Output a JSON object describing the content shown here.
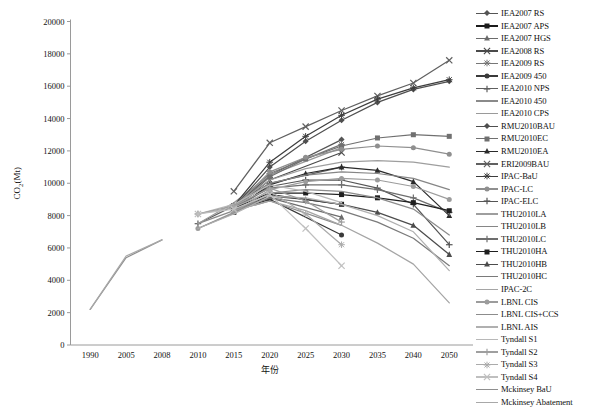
{
  "chart_data": {
    "type": "line",
    "title": "",
    "xlabel": "年份",
    "ylabel": "CO2(Mt)",
    "ylabel_parts": {
      "main": "CO",
      "sub": "2",
      "unit": "(Mt)"
    },
    "categories": [
      "1990",
      "2005",
      "2008",
      "2010",
      "2015",
      "2020",
      "2025",
      "2030",
      "2035",
      "2040",
      "2050"
    ],
    "ylim": [
      0,
      20000
    ],
    "ytick_labels": [
      "0",
      "2000",
      "4000",
      "6000",
      "8000",
      "10000",
      "12000",
      "14000",
      "16000",
      "18000",
      "20000"
    ],
    "ytick_values": [
      0,
      2000,
      4000,
      6000,
      8000,
      10000,
      12000,
      14000,
      16000,
      18000,
      20000
    ],
    "grid": false,
    "legend_position": "right",
    "series": [
      {
        "name": "IEA2007 RS",
        "marker": "diamond",
        "color": "#555555",
        "values": [
          null,
          null,
          null,
          null,
          8500,
          10500,
          null,
          12700,
          null,
          null,
          null
        ]
      },
      {
        "name": "IEA2007 APS",
        "marker": "square",
        "color": "#1c1c1c",
        "values": [
          null,
          null,
          null,
          null,
          8200,
          9300,
          null,
          8700,
          null,
          null,
          null
        ]
      },
      {
        "name": "IEA2007 HGS",
        "marker": "triangle",
        "color": "#6b6b6b",
        "values": [
          null,
          null,
          null,
          null,
          8350,
          9100,
          null,
          7900,
          null,
          null,
          null
        ]
      },
      {
        "name": "IEA2008 RS",
        "marker": "cross",
        "color": "#4a4a4a",
        "values": [
          null,
          null,
          null,
          null,
          8450,
          10200,
          null,
          11900,
          null,
          null,
          null
        ]
      },
      {
        "name": "IEA2009 RS",
        "marker": "star",
        "color": "#777777",
        "values": [
          null,
          null,
          null,
          null,
          8550,
          10600,
          null,
          12400,
          null,
          null,
          null
        ]
      },
      {
        "name": "IEA2009 450",
        "marker": "circle",
        "color": "#3a3a3a",
        "values": [
          null,
          null,
          null,
          null,
          8300,
          9000,
          null,
          6800,
          null,
          null,
          null
        ]
      },
      {
        "name": "IEA2010 NPS",
        "marker": "plus",
        "color": "#5f5f5f",
        "values": [
          null,
          null,
          null,
          7500,
          8600,
          10000,
          null,
          11000,
          null,
          null,
          null
        ]
      },
      {
        "name": "IEA2010 450",
        "marker": "dash",
        "color": "#8a8a8a",
        "values": [
          null,
          null,
          null,
          7500,
          8300,
          8900,
          null,
          7400,
          null,
          null,
          null
        ]
      },
      {
        "name": "IEA2010 CPS",
        "marker": "dash",
        "color": "#9a9a9a",
        "values": [
          null,
          null,
          null,
          7500,
          8800,
          10500,
          null,
          12200,
          null,
          null,
          null
        ]
      },
      {
        "name": "RMU2010BAU",
        "marker": "diamond",
        "color": "#4f4f4f",
        "values": [
          null,
          null,
          null,
          null,
          8500,
          11000,
          12600,
          13900,
          15000,
          15800,
          16300
        ]
      },
      {
        "name": "RMU2010EC",
        "marker": "square",
        "color": "#707070",
        "values": [
          null,
          null,
          null,
          null,
          8400,
          10400,
          11500,
          12300,
          12800,
          13000,
          12900
        ]
      },
      {
        "name": "RMU2010EA",
        "marker": "triangle",
        "color": "#2b2b2b",
        "values": [
          null,
          null,
          null,
          null,
          8350,
          9900,
          10600,
          11000,
          10800,
          10100,
          8000
        ]
      },
      {
        "name": "ERI2009BAU",
        "marker": "cross",
        "color": "#606060",
        "values": [
          null,
          null,
          null,
          null,
          9500,
          12500,
          13500,
          14500,
          15400,
          16200,
          17600
        ]
      },
      {
        "name": "IPAC-BaU",
        "marker": "star",
        "color": "#3d3d3d",
        "values": [
          null,
          null,
          null,
          null,
          8600,
          11300,
          12900,
          14200,
          15200,
          15900,
          16400
        ]
      },
      {
        "name": "IPAC-LC",
        "marker": "circle",
        "color": "#8f8f8f",
        "values": [
          null,
          null,
          null,
          null,
          8500,
          10700,
          11600,
          12100,
          12300,
          12200,
          11800
        ]
      },
      {
        "name": "IPAC-ELC",
        "marker": "plus",
        "color": "#555555",
        "values": [
          null,
          null,
          null,
          null,
          8400,
          9800,
          10200,
          10200,
          9700,
          8700,
          6200
        ]
      },
      {
        "name": "THU2010LA",
        "marker": "dash",
        "color": "#9e9e9e",
        "values": [
          null,
          null,
          null,
          null,
          8600,
          10200,
          10900,
          11300,
          11400,
          11300,
          11000
        ]
      },
      {
        "name": "THU2010LB",
        "marker": "dash",
        "color": "#868686",
        "values": [
          null,
          null,
          null,
          null,
          8550,
          10000,
          10500,
          10700,
          10600,
          10300,
          9600
        ]
      },
      {
        "name": "THU2010LC",
        "marker": "plus",
        "color": "#6e6e6e",
        "values": [
          null,
          null,
          null,
          null,
          8500,
          9700,
          9900,
          9900,
          9600,
          9100,
          8200
        ]
      },
      {
        "name": "THU2010HA",
        "marker": "square",
        "color": "#1f1f1f",
        "values": [
          null,
          null,
          null,
          null,
          8450,
          9400,
          9400,
          9300,
          9100,
          8800,
          8300
        ]
      },
      {
        "name": "THU2010HB",
        "marker": "triangle",
        "color": "#4c4c4c",
        "values": [
          null,
          null,
          null,
          null,
          8400,
          9200,
          9000,
          8700,
          8200,
          7400,
          5600
        ]
      },
      {
        "name": "THU2010HC",
        "marker": "dash",
        "color": "#7a7a7a",
        "values": [
          null,
          null,
          null,
          null,
          8350,
          9100,
          8800,
          8300,
          7600,
          6600,
          4900
        ]
      },
      {
        "name": "IPAC-2C",
        "marker": "dash",
        "color": "#a5a5a5",
        "values": [
          null,
          null,
          null,
          null,
          8300,
          8900,
          8300,
          7400,
          6300,
          5000,
          2600
        ]
      },
      {
        "name": "LBNL CIS",
        "marker": "circle",
        "color": "#9c9c9c",
        "values": [
          null,
          null,
          null,
          7200,
          8200,
          9600,
          10100,
          10300,
          10200,
          9800,
          9000
        ]
      },
      {
        "name": "LBNL CIS+CCS",
        "marker": "dash",
        "color": "#8c8c8c",
        "values": [
          null,
          null,
          null,
          7200,
          8150,
          9400,
          9600,
          9500,
          9100,
          8400,
          6800
        ]
      },
      {
        "name": "LBNL AIS",
        "marker": "dash",
        "color": "#b0b0b0",
        "values": [
          null,
          null,
          null,
          7200,
          8100,
          9200,
          9100,
          8700,
          8000,
          7000,
          4600
        ]
      },
      {
        "name": "Tyndall S1",
        "marker": "dash",
        "color": "#b8b8b8",
        "values": [
          null,
          null,
          null,
          8100,
          8700,
          9900,
          9500,
          8800,
          null,
          null,
          null
        ]
      },
      {
        "name": "Tyndall S2",
        "marker": "plus",
        "color": "#9f9f9f",
        "values": [
          null,
          null,
          null,
          8100,
          8600,
          9700,
          8900,
          7600,
          null,
          null,
          null
        ]
      },
      {
        "name": "Tyndall S3",
        "marker": "star",
        "color": "#ababab",
        "values": [
          null,
          null,
          null,
          8100,
          8500,
          9500,
          8100,
          6200,
          null,
          null,
          null
        ]
      },
      {
        "name": "Tyndall S4",
        "marker": "cross",
        "color": "#bfbfbf",
        "values": [
          null,
          null,
          null,
          8100,
          8400,
          9300,
          7200,
          4900,
          null,
          null,
          null
        ]
      },
      {
        "name": "Mckinsey BaU",
        "marker": "dash",
        "color": "#8f8f8f",
        "values": [
          2200,
          5400,
          6500,
          null,
          null,
          null,
          null,
          null,
          null,
          null,
          null
        ]
      },
      {
        "name": "Mckinsey Abatement",
        "marker": "dash",
        "color": "#a8a8a8",
        "values": [
          2200,
          5500,
          6500,
          null,
          null,
          null,
          null,
          null,
          null,
          null,
          null
        ]
      }
    ]
  },
  "axes": {
    "x_title": "年份",
    "y_title_main": "CO",
    "y_title_sub": "2",
    "y_title_unit": "(Mt)"
  },
  "legend": {
    "items": [
      {
        "label": "IEA2007 RS"
      },
      {
        "label": "IEA2007 APS"
      },
      {
        "label": "IEA2007 HGS"
      },
      {
        "label": "IEA2008 RS"
      },
      {
        "label": "IEA2009 RS"
      },
      {
        "label": "IEA2009 450"
      },
      {
        "label": "IEA2010 NPS"
      },
      {
        "label": "IEA2010 450"
      },
      {
        "label": "IEA2010 CPS"
      },
      {
        "label": "RMU2010BAU"
      },
      {
        "label": "RMU2010EC"
      },
      {
        "label": "RMU2010EA"
      },
      {
        "label": "ERI2009BAU"
      },
      {
        "label": "IPAC-BaU"
      },
      {
        "label": "IPAC-LC"
      },
      {
        "label": "IPAC-ELC"
      },
      {
        "label": "THU2010LA"
      },
      {
        "label": "THU2010LB"
      },
      {
        "label": "THU2010LC"
      },
      {
        "label": "THU2010HA"
      },
      {
        "label": "THU2010HB"
      },
      {
        "label": "THU2010HC"
      },
      {
        "label": "IPAC-2C"
      },
      {
        "label": "LBNL CIS"
      },
      {
        "label": "LBNL CIS+CCS"
      },
      {
        "label": "LBNL AIS"
      },
      {
        "label": "Tyndall S1"
      },
      {
        "label": "Tyndall S2"
      },
      {
        "label": "Tyndall S3"
      },
      {
        "label": "Tyndall S4"
      },
      {
        "label": "Mckinsey BaU"
      },
      {
        "label": "Mckinsey Abatement"
      }
    ]
  }
}
